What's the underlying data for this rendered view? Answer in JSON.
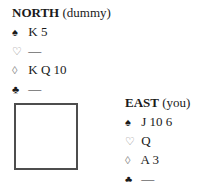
{
  "north": {
    "name": "NORTH",
    "role": "(dummy)",
    "holdings": [
      {
        "suit": "spades",
        "symbol": "♠",
        "cards": "K 5"
      },
      {
        "suit": "hearts",
        "symbol": "♡",
        "cards": "—"
      },
      {
        "suit": "diamonds",
        "symbol": "◊",
        "cards": "K Q 10"
      },
      {
        "suit": "clubs",
        "symbol": "♣",
        "cards": "—"
      }
    ]
  },
  "east": {
    "name": "EAST",
    "role": "(you)",
    "holdings": [
      {
        "suit": "spades",
        "symbol": "♠",
        "cards": "J 10 6"
      },
      {
        "suit": "hearts",
        "symbol": "♡",
        "cards": "Q"
      },
      {
        "suit": "diamonds",
        "symbol": "◊",
        "cards": "A 3"
      },
      {
        "suit": "clubs",
        "symbol": "♣",
        "cards": "—"
      }
    ]
  }
}
